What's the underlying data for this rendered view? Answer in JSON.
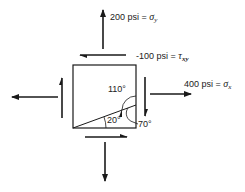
{
  "diagram": {
    "type": "stress element",
    "stroke_color": "#1a1a1a",
    "labels": {
      "sigma_y": {
        "value": "200 psi = ",
        "symbol": "σ",
        "subscript": "y"
      },
      "tau_xy": {
        "value": "-100 psi = ",
        "symbol": "τ",
        "subscript": "xy"
      },
      "sigma_x": {
        "value": "400 psi = ",
        "symbol": "σ",
        "subscript": "x"
      }
    },
    "angles": {
      "a110": "110°",
      "a20": "20°",
      "a70": "70°"
    },
    "arrows": [
      {
        "name": "normal-stress-top",
        "direction": "up"
      },
      {
        "name": "shear-stress-top",
        "direction": "left"
      },
      {
        "name": "shear-stress-right",
        "direction": "down"
      },
      {
        "name": "normal-stress-right",
        "direction": "right"
      },
      {
        "name": "normal-stress-left",
        "direction": "left"
      },
      {
        "name": "shear-stress-left",
        "direction": "up"
      },
      {
        "name": "shear-stress-bottom",
        "direction": "right"
      },
      {
        "name": "normal-stress-bottom",
        "direction": "down"
      }
    ]
  }
}
